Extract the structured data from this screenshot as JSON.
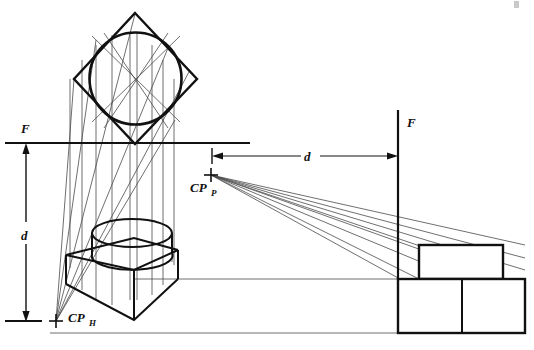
{
  "figure": {
    "background_color": "#ffffff",
    "ink_color": "#111111",
    "light_ink_color": "#555555",
    "width": 534,
    "height": 350
  },
  "labels": {
    "f_top_left": "F",
    "f_right": "F",
    "d_vertical": "d",
    "d_horizontal": "d",
    "cp_p_main": "CP",
    "cp_p_sub": "P",
    "cp_h_main": "CP",
    "cp_h_sub": "H"
  },
  "geometry": {
    "plan": {
      "square_vertices": [
        [
          135,
          13
        ],
        [
          197,
          79
        ],
        [
          135,
          144
        ],
        [
          74,
          79
        ]
      ],
      "circle_center": [
        135.5,
        78.5
      ],
      "circle_radius": 46
    },
    "horizon_line": {
      "x1": 5,
      "y1": 143,
      "x2": 250,
      "y2": 143
    },
    "ground_line": {
      "x1": 5,
      "y1": 321,
      "x2": 40,
      "y2": 321
    },
    "vertical_dimension": {
      "x": 26,
      "y1": 145,
      "y2": 320,
      "label": "d"
    },
    "horizontal_dimension": {
      "y": 156,
      "x1": 212,
      "x2": 397,
      "label": "d"
    },
    "picture_plane_vertical": {
      "x": 398,
      "y1": 110,
      "y2": 280
    },
    "station_point_plan": {
      "x": 211,
      "y": 175
    },
    "station_point_elev": {
      "x": 56,
      "y": 321
    },
    "projector_x_positions": [
      70,
      82,
      96,
      112,
      130,
      137,
      152,
      163
    ],
    "right_lower_box": {
      "x": 398,
      "y": 279,
      "w": 127,
      "h": 54,
      "divider_x": 462
    },
    "right_upper_box": {
      "x": 419,
      "y": 245,
      "w": 84,
      "h": 34
    },
    "left_cube_top_face": [
      [
        66,
        255
      ],
      [
        134,
        238
      ],
      [
        178,
        250
      ],
      [
        134,
        270
      ]
    ],
    "left_cube_bottom_vertex": [
      134,
      320
    ],
    "cylinder": {
      "top_ellipse_center": [
        132,
        233
      ],
      "top_rx": 40,
      "top_ry": 14,
      "bottom_ellipse_center": [
        132,
        262
      ],
      "bottom_rx": 40,
      "bottom_ry": 14
    }
  }
}
